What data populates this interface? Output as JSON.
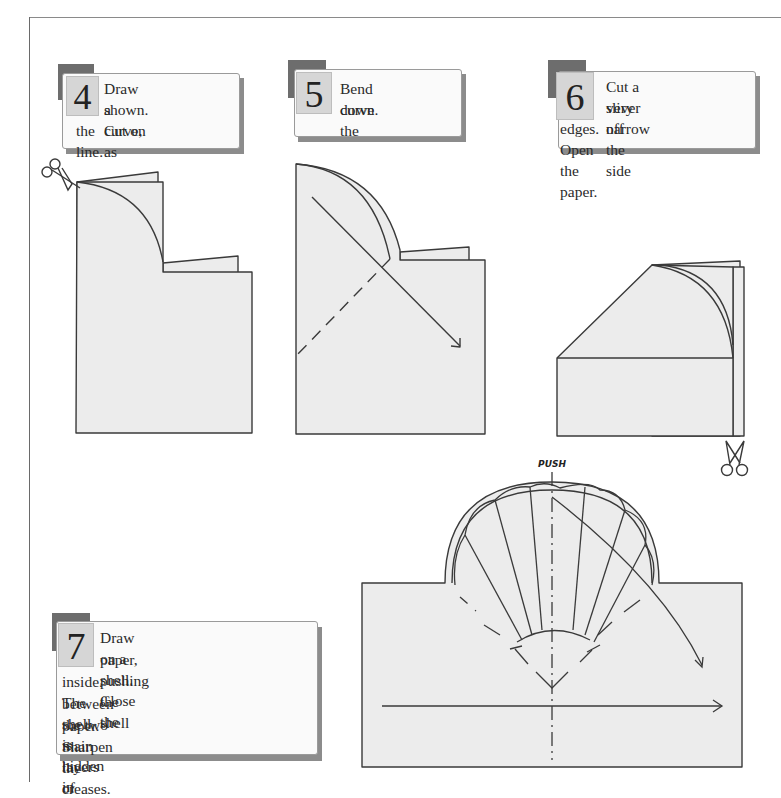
{
  "steps": [
    {
      "number": "4",
      "line1": "Draw a curve, as",
      "line2": "shown. Cut on",
      "line3": "the line."
    },
    {
      "number": "5",
      "line1": "Bend down the",
      "line2": "curve."
    },
    {
      "number": "6",
      "line1": "Cut a very narrow",
      "line2": "sliver off the side",
      "line3": "edges. Open the paper."
    },
    {
      "number": "7",
      "line1": "Draw on a shell. Close the",
      "line2": "paper, pushing the shell",
      "line3": "inside. The shell is hidden in",
      "line4": "between the two main layers of",
      "line5": "paper. Sharpen the creases."
    }
  ],
  "labels": {
    "push": "PUSH"
  },
  "icons": {
    "scissors_step4": "scissors-icon",
    "scissors_step6": "scissors-icon"
  },
  "colors": {
    "paper": "#ececec",
    "line": "#3a3a3a",
    "number_box": "#d6d6d6",
    "tab": "#6d6d6d",
    "card": "#fafafa"
  }
}
